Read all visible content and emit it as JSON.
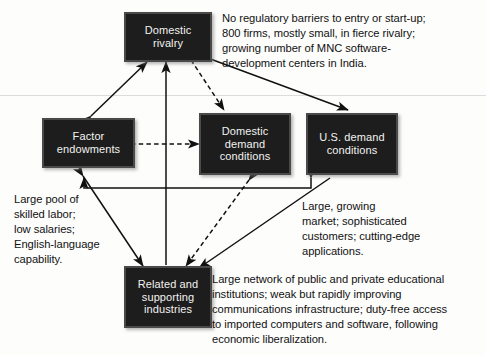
{
  "figure": {
    "background_color": "#fdfdfc",
    "node_fill": "#1d1d1d",
    "node_text_color": "#f2f2f0",
    "link_color": "#111111"
  },
  "nodes": {
    "domestic_rivalry": {
      "label": "Domestic\nrivalry"
    },
    "factor_endowments": {
      "label": "Factor\nendowments"
    },
    "domestic_demand": {
      "label": "Domestic\ndemand\nconditions"
    },
    "us_demand": {
      "label": "U.S.\ndemand\nconditions"
    },
    "related_supporting": {
      "label": "Related and\nsupporting\nindustries"
    }
  },
  "notes": {
    "rivalry_note": "No regulatory barriers to entry or start-up;\n800 firms, mostly small, in fierce rivalry;\ngrowing number of MNC software-\ndevelopment centers in India.",
    "factor_note": "Large pool of\nskilled labor;\nlow salaries;\nEnglish-language\ncapability.",
    "demand_note": "Large, growing\nmarket; sophisticated\ncustomers; cutting-edge\napplications.",
    "supporting_note": "Large network of public and private educational\ninstitutions; weak but rapidly improving\ncommunications infrastructure; duty-free access\nto imported computers and software, following\neconomic liberalization."
  },
  "links": [
    {
      "name": "factor-endowments-to-domestic-rivalry",
      "style": "solid",
      "heads": "both"
    },
    {
      "name": "domestic-rivalry-to-us-demand",
      "style": "solid",
      "heads": "both"
    },
    {
      "name": "domestic-rivalry-to-domestic-demand",
      "style": "dashed",
      "heads": "end"
    },
    {
      "name": "related-supporting-to-domestic-rivalry",
      "style": "solid",
      "heads": "end"
    },
    {
      "name": "factor-endowments-to-domestic-demand",
      "style": "dashed",
      "heads": "both"
    },
    {
      "name": "factor-endowments-to-related-supporting",
      "style": "solid",
      "heads": "both"
    },
    {
      "name": "domestic-demand-to-related-supporting",
      "style": "dashed",
      "heads": "both"
    },
    {
      "name": "us-demand-to-related-supporting",
      "style": "solid",
      "heads": "end"
    },
    {
      "name": "us-demand-to-factor-endowments-elbow",
      "style": "solid",
      "heads": "both"
    }
  ]
}
